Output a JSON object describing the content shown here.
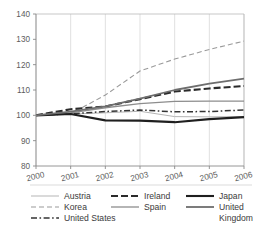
{
  "chart_data": {
    "type": "line",
    "title": "",
    "subtitle": "",
    "xlabel": "",
    "ylabel": "",
    "x": [
      2000,
      2001,
      2002,
      2003,
      2004,
      2005,
      2006
    ],
    "xtick_labels": [
      "2000",
      "2001",
      "2002",
      "2003",
      "2004",
      "2005",
      "2006"
    ],
    "ytick_labels": [
      "80",
      "90",
      "100",
      "110",
      "120",
      "130",
      "140"
    ],
    "yticks": [
      80,
      90,
      100,
      110,
      120,
      130,
      140
    ],
    "ylim": [
      80,
      140
    ],
    "xlim": [
      2000,
      2006
    ],
    "grid": "vertical-only",
    "legend_position": "bottom",
    "index_base": 100,
    "series": [
      {
        "name": "Austria",
        "values": [
          100.0,
          100.5,
          101.0,
          101.6,
          99.5,
          99.4,
          99.5
        ],
        "color": "#b5b5b5",
        "style": "solid",
        "width": 1.0,
        "dash": "none"
      },
      {
        "name": "Korea",
        "values": [
          100.0,
          100.6,
          108.0,
          117.5,
          122.2,
          126.0,
          129.3
        ],
        "color": "#9a9a9a",
        "style": "dashed",
        "width": 1.1,
        "dash": "5,3"
      },
      {
        "name": "United States",
        "values": [
          100.0,
          100.6,
          101.5,
          102.1,
          101.4,
          101.5,
          102.1
        ],
        "color": "#333333",
        "style": "dash-dot",
        "width": 1.5,
        "dash": "6,2.5,1.6,2.5"
      },
      {
        "name": "Ireland",
        "values": [
          100.0,
          102.4,
          103.5,
          106.4,
          109.4,
          110.6,
          111.6
        ],
        "color": "#2b2b2b",
        "style": "dashed",
        "width": 2.1,
        "dash": "7,3"
      },
      {
        "name": "Spain",
        "values": [
          100.0,
          101.0,
          103.0,
          104.6,
          105.5,
          105.6,
          105.6
        ],
        "color": "#8d8d8d",
        "style": "solid",
        "width": 1.3,
        "dash": "none"
      },
      {
        "name": "Japan",
        "values": [
          100.0,
          100.5,
          98.0,
          97.9,
          97.3,
          98.5,
          99.3
        ],
        "color": "#1f1f1f",
        "style": "solid",
        "width": 2.1,
        "dash": "none"
      },
      {
        "name": "United Kingdom",
        "values": [
          100.0,
          101.5,
          103.5,
          106.6,
          110.0,
          112.5,
          114.5
        ],
        "color": "#6e6e6e",
        "style": "solid",
        "width": 1.8,
        "dash": "none"
      }
    ]
  },
  "legend": {
    "columns": [
      [
        "Austria",
        "Korea",
        "United States"
      ],
      [
        "Ireland",
        "Spain"
      ],
      [
        "Japan",
        "United",
        "Kingdom"
      ]
    ],
    "entries": [
      {
        "label": "Austria",
        "series": "Austria"
      },
      {
        "label": "Ireland",
        "series": "Ireland"
      },
      {
        "label": "Japan",
        "series": "Japan"
      },
      {
        "label": "Korea",
        "series": "Korea"
      },
      {
        "label": "Spain",
        "series": "Spain"
      },
      {
        "label": "United",
        "series": "United Kingdom"
      },
      {
        "label": "United States",
        "series": "United States"
      },
      {
        "label": "Kingdom",
        "series": "United Kingdom-cont"
      }
    ]
  }
}
